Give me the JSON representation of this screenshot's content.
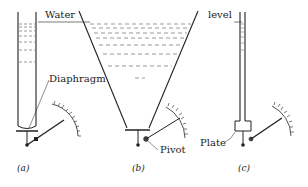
{
  "labels": {
    "water": "Water",
    "level": "level",
    "diaphragm": "Diaphragm",
    "pivot": "Pivot",
    "plate": "Plate"
  },
  "captions": {
    "a": "(a)",
    "b": "(b)",
    "c": "(c)"
  },
  "panels": [
    {
      "id": "a",
      "vessel": "narrow tube",
      "sensor": "Diaphragm"
    },
    {
      "id": "b",
      "vessel": "tapered tank",
      "sensor": "Pivot"
    },
    {
      "id": "c",
      "vessel": "thin tube",
      "sensor": "Plate"
    }
  ]
}
